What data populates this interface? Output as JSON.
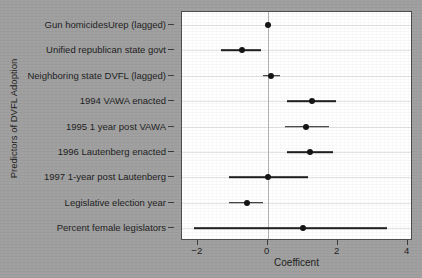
{
  "chart_data": {
    "type": "scatter",
    "title": "",
    "xlabel": "Coefficent",
    "ylabel": "Predictors of DVFL Adoption",
    "xlim": [
      -2.45,
      4.15
    ],
    "xticks": [
      -2,
      0,
      2,
      4
    ],
    "xtick_labels": [
      "−2",
      "0",
      "2",
      "4"
    ],
    "grid": true,
    "legend": "none",
    "reference_line": 0,
    "categories": [
      "Gun homicidesUrep (lagged)",
      "Unified republican state govt",
      "Neighboring state DVFL (lagged)",
      "1994 VAWA enacted",
      "1995 1 year post VAWA",
      "1996 Lautenberg enacted",
      "1997 1-year post Lautenberg",
      "Legislative election year",
      "Percent female legislators"
    ],
    "values": [
      0.02,
      -0.75,
      0.1,
      1.25,
      1.1,
      1.2,
      0.0,
      -0.6,
      1.0
    ],
    "ci_low": [
      -0.05,
      -1.35,
      -0.15,
      0.55,
      0.5,
      0.55,
      -1.1,
      -1.1,
      -2.1
    ],
    "ci_high": [
      0.1,
      -0.2,
      0.35,
      1.95,
      1.75,
      1.85,
      1.15,
      -0.15,
      3.4
    ],
    "series": [
      {
        "name": "Coefficient estimate with confidence interval",
        "values": [
          0.02,
          -0.75,
          0.1,
          1.25,
          1.1,
          1.2,
          0.0,
          -0.6,
          1.0
        ]
      }
    ]
  }
}
